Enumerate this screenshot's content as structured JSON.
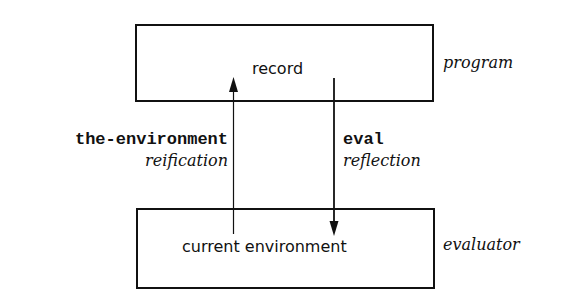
{
  "diagram": {
    "top_box": {
      "label": "record",
      "side_label": "program"
    },
    "bottom_box": {
      "label": "current environment",
      "side_label": "evaluator"
    },
    "up_arrow": {
      "code_label": "the-environment",
      "term_label": "reification"
    },
    "down_arrow": {
      "code_label": "eval",
      "term_label": "reflection"
    }
  }
}
